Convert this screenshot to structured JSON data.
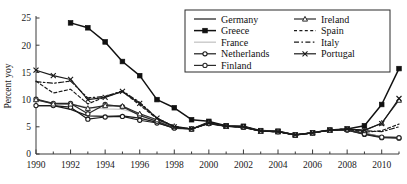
{
  "chart_data": {
    "type": "line",
    "title": "",
    "xlabel": "",
    "ylabel": "Percent yoy",
    "xlim": [
      1990,
      2011
    ],
    "ylim": [
      0,
      25
    ],
    "yticks": [
      0,
      5,
      10,
      15,
      20,
      25
    ],
    "xticks": [
      1990,
      1992,
      1994,
      1996,
      1998,
      2000,
      2002,
      2004,
      2006,
      2008,
      2010
    ],
    "xtick_labels": [
      "1990",
      "1992",
      "1994",
      "1996",
      "1998",
      "2000",
      "2002",
      "2004",
      "2006",
      "2008",
      "2010"
    ],
    "ytick_labels": [
      "0",
      "5",
      "10",
      "15",
      "20",
      "25"
    ],
    "grid": false,
    "legend_position": "top-right",
    "x": [
      1990,
      1991,
      1992,
      1993,
      1994,
      1995,
      1996,
      1997,
      1998,
      1999,
      2000,
      2001,
      2002,
      2003,
      2004,
      2005,
      2006,
      2007,
      2008,
      2009,
      2010,
      2011
    ],
    "series": [
      {
        "name": "Germany",
        "style": "solid-plain",
        "color": "#1a1a1a",
        "values": [
          8.9,
          8.9,
          8.2,
          7.0,
          6.9,
          7.0,
          6.6,
          5.8,
          4.7,
          4.6,
          5.9,
          5.1,
          5.1,
          4.2,
          4.2,
          3.5,
          3.9,
          4.4,
          4.5,
          3.8,
          3.2,
          3.0
        ]
      },
      {
        "name": "Greece",
        "style": "solid-square",
        "color": "#111111",
        "values": [
          null,
          null,
          24.1,
          23.2,
          20.6,
          17.0,
          14.4,
          10.0,
          8.5,
          6.3,
          6.0,
          5.2,
          5.1,
          4.3,
          4.2,
          3.5,
          3.9,
          4.4,
          4.6,
          5.2,
          9.1,
          15.7
        ]
      },
      {
        "name": "France",
        "style": "solid-light",
        "color": "#c9c9c9",
        "values": [
          9.9,
          9.3,
          9.1,
          8.6,
          8.3,
          8.2,
          7.4,
          6.2,
          4.9,
          4.6,
          5.6,
          5.0,
          4.9,
          4.2,
          4.1,
          3.5,
          3.9,
          4.4,
          4.4,
          3.7,
          3.2,
          3.1
        ]
      },
      {
        "name": "Netherlands",
        "style": "solid-circle",
        "color": "#1a1a1a",
        "values": [
          8.9,
          8.9,
          8.6,
          6.4,
          6.8,
          6.9,
          6.2,
          5.7,
          4.8,
          4.6,
          5.6,
          5.1,
          4.9,
          4.2,
          4.1,
          3.5,
          3.9,
          4.4,
          4.4,
          3.6,
          3.0,
          2.9
        ]
      },
      {
        "name": "Finland",
        "style": "solid-circle",
        "color": "#2a2a2a",
        "values": [
          10.1,
          9.3,
          9.3,
          7.4,
          9.1,
          8.7,
          7.1,
          6.0,
          4.8,
          4.6,
          5.6,
          5.1,
          4.9,
          4.2,
          4.1,
          3.5,
          3.9,
          4.4,
          4.4,
          3.7,
          3.1,
          3.0
        ]
      },
      {
        "name": "Ireland",
        "style": "solid-triangle",
        "color": "#2a2a2a",
        "values": [
          10.0,
          9.2,
          9.2,
          8.4,
          8.9,
          8.8,
          7.4,
          6.3,
          5.1,
          4.6,
          5.7,
          5.1,
          5.0,
          4.2,
          4.1,
          3.5,
          3.9,
          4.4,
          4.6,
          4.3,
          5.7,
          9.9
        ]
      },
      {
        "name": "Spain",
        "style": "dotted",
        "color": "#1a1a1a",
        "values": [
          13.4,
          11.2,
          11.9,
          9.2,
          10.5,
          11.5,
          9.0,
          6.5,
          5.1,
          4.6,
          5.7,
          5.1,
          5.0,
          4.2,
          4.1,
          3.5,
          3.9,
          4.4,
          4.6,
          4.0,
          4.3,
          5.5
        ]
      },
      {
        "name": "Italy",
        "style": "dashed",
        "color": "#1a1a1a",
        "values": [
          13.3,
          13.0,
          13.4,
          10.3,
          10.6,
          11.6,
          9.5,
          6.6,
          5.0,
          4.6,
          5.7,
          5.1,
          5.0,
          4.2,
          4.1,
          3.5,
          3.9,
          4.4,
          4.6,
          4.3,
          4.1,
          5.0
        ]
      },
      {
        "name": "Portugal",
        "style": "solid-x",
        "color": "#1a1a1a",
        "values": [
          15.4,
          14.4,
          13.7,
          10.0,
          10.4,
          11.5,
          9.3,
          6.6,
          5.0,
          4.6,
          5.7,
          5.1,
          5.0,
          4.2,
          4.1,
          3.5,
          3.9,
          4.4,
          4.6,
          4.4,
          5.6,
          10.2
        ]
      }
    ],
    "legend": {
      "column_left": [
        "Germany",
        "Greece",
        "France",
        "Netherlands",
        "Finland"
      ],
      "column_right": [
        "Ireland",
        "Spain",
        "Italy",
        "Portugal"
      ]
    }
  }
}
